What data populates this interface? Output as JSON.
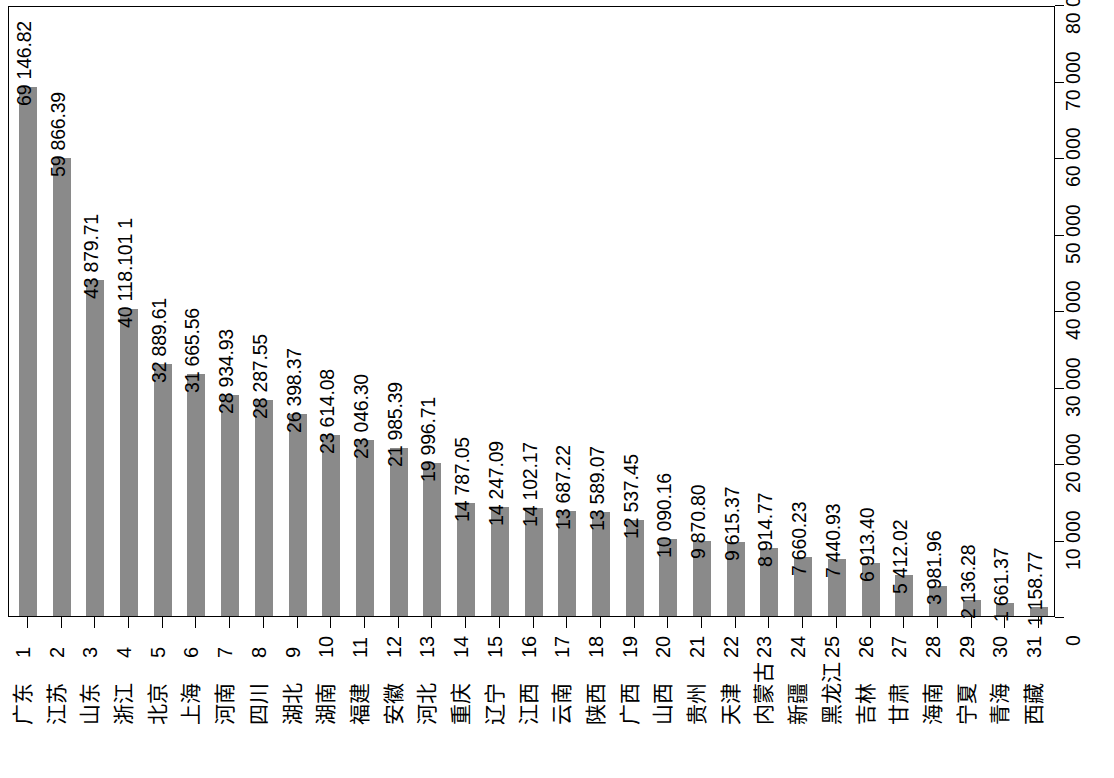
{
  "chart_data": {
    "type": "bar",
    "orientation": "vertical",
    "title": "",
    "subtitle": "",
    "xlabel": "",
    "ylabel": "",
    "grid": false,
    "legend": null,
    "ylim": [
      0,
      80000
    ],
    "ytick_labels": [
      "0",
      "10 000",
      "20 000",
      "30 000",
      "40 000",
      "50 000",
      "60 000",
      "70 000",
      "80 000"
    ],
    "ytick_values": [
      0,
      10000,
      20000,
      30000,
      40000,
      50000,
      60000,
      70000,
      80000
    ],
    "bar_color": "#8a8a8a",
    "axis_color": "#000000",
    "rank_labels": [
      "1",
      "2",
      "3",
      "4",
      "5",
      "6",
      "7",
      "8",
      "9",
      "10",
      "11",
      "12",
      "13",
      "14",
      "15",
      "16",
      "17",
      "18",
      "19",
      "20",
      "21",
      "22",
      "23",
      "24",
      "25",
      "26",
      "27",
      "28",
      "29",
      "30",
      "31"
    ],
    "categories": [
      "广东",
      "江苏",
      "山东",
      "浙江",
      "北京",
      "上海",
      "河南",
      "四川",
      "湖北",
      "湖南",
      "福建",
      "安徽",
      "河北",
      "重庆",
      "辽宁",
      "江西",
      "云南",
      "陕西",
      "广西",
      "山西",
      "贵州",
      "天津",
      "内蒙古",
      "新疆",
      "黑龙江",
      "吉林",
      "甘肃",
      "海南",
      "宁夏",
      "青海",
      "西藏"
    ],
    "values": [
      69146.82,
      59866.39,
      43879.71,
      40118.1011,
      32889.61,
      31665.56,
      28934.93,
      28287.55,
      26398.37,
      23614.08,
      23046.3,
      21985.39,
      19996.71,
      14787.05,
      14247.09,
      14102.17,
      13687.22,
      13589.07,
      12537.45,
      10090.16,
      9870.8,
      9615.37,
      8914.77,
      7660.23,
      7440.93,
      6913.4,
      5412.02,
      3981.96,
      2136.28,
      1661.37,
      1158.77
    ],
    "value_labels": [
      "69 146.82",
      "59 866.39",
      "43 879.71",
      "40 118.101 1",
      "32 889.61",
      "31 665.56",
      "28 934.93",
      "28 287.55",
      "26 398.37",
      "23 614.08",
      "23 046.30",
      "21 985.39",
      "19 996.71",
      "14 787.05",
      "14 247.09",
      "14 102.17",
      "13 687.22",
      "13 589.07",
      "12 537.45",
      "10 090.16",
      "9 870.80",
      "9 615.37",
      "8 914.77",
      "7 660.23",
      "7 440.93",
      "6 913.40",
      "5 412.02",
      "3 981.96",
      "2 136.28",
      "1 661.37",
      "1 158.77"
    ]
  }
}
